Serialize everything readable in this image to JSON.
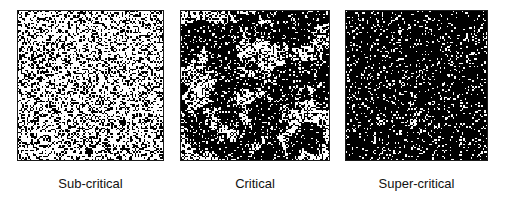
{
  "figure": {
    "background_color": "#ffffff",
    "border_color": "#1a1a1a",
    "ink_color": "#000000",
    "paper_color": "#ffffff",
    "panel_count": 3
  },
  "panels": [
    {
      "id": "sub-critical",
      "caption": "Sub-critical",
      "regime": "sub-critical",
      "x": 17,
      "y": 10,
      "width": 147,
      "height": 151,
      "occupancy": 0.42,
      "cluster_scale": 1.0,
      "cluster_threshold": 0.985,
      "blob": {
        "x": 0.48,
        "y": 0.94,
        "r": 0.028
      }
    },
    {
      "id": "critical",
      "caption": "Critical",
      "regime": "critical",
      "x": 180,
      "y": 10,
      "width": 150,
      "height": 151,
      "occupancy": 0.5,
      "cluster_scale": 7.0,
      "cluster_threshold": 0.46,
      "blob": null
    },
    {
      "id": "super-critical",
      "caption": "Super-critical",
      "regime": "super-critical",
      "x": 345,
      "y": 10,
      "width": 143,
      "height": 151,
      "occupancy": 0.72,
      "cluster_scale": 4.0,
      "cluster_threshold": 0.18,
      "blob": null
    }
  ],
  "chart_data": {
    "type": "heatmap",
    "title": "",
    "xlabel": "",
    "ylabel": "",
    "categories": [
      "Sub-critical",
      "Critical",
      "Super-critical"
    ],
    "series": [
      {
        "name": "black (occupied) site fraction",
        "values": [
          0.42,
          0.5,
          0.72
        ]
      },
      {
        "name": "largest-cluster correlation length (relative)",
        "values": [
          1.0,
          7.0,
          4.0
        ]
      }
    ],
    "legend_position": "none",
    "grid": false
  }
}
